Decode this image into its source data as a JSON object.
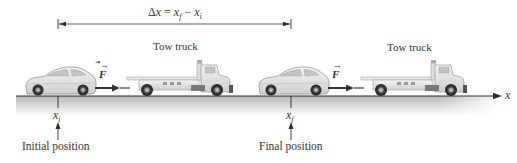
{
  "displacement": {
    "label_delta": "Δ",
    "label_x": "x",
    "label_equals": " = ",
    "label_xf": "x",
    "label_xf_sub": "f",
    "label_minus": " − ",
    "label_xi": "x",
    "label_xi_sub": "i"
  },
  "scenes": [
    {
      "truck_label": "Tow truck",
      "force_label": "F",
      "position_symbol": "x",
      "position_sub": "i",
      "position_caption": "Initial position"
    },
    {
      "truck_label": "Tow truck",
      "force_label": "F",
      "position_symbol": "x",
      "position_sub": "f",
      "position_caption": "Final position"
    }
  ],
  "axis": {
    "label": "x"
  },
  "colors": {
    "line": "#2b2b2b",
    "ground_top": "#bdbdbd",
    "ground_bottom": "#ffffff",
    "vehicle_body": "#e6e6e6",
    "vehicle_outline": "#8a8a8a",
    "wheel": "#3a3a3a",
    "text": "#333333"
  }
}
